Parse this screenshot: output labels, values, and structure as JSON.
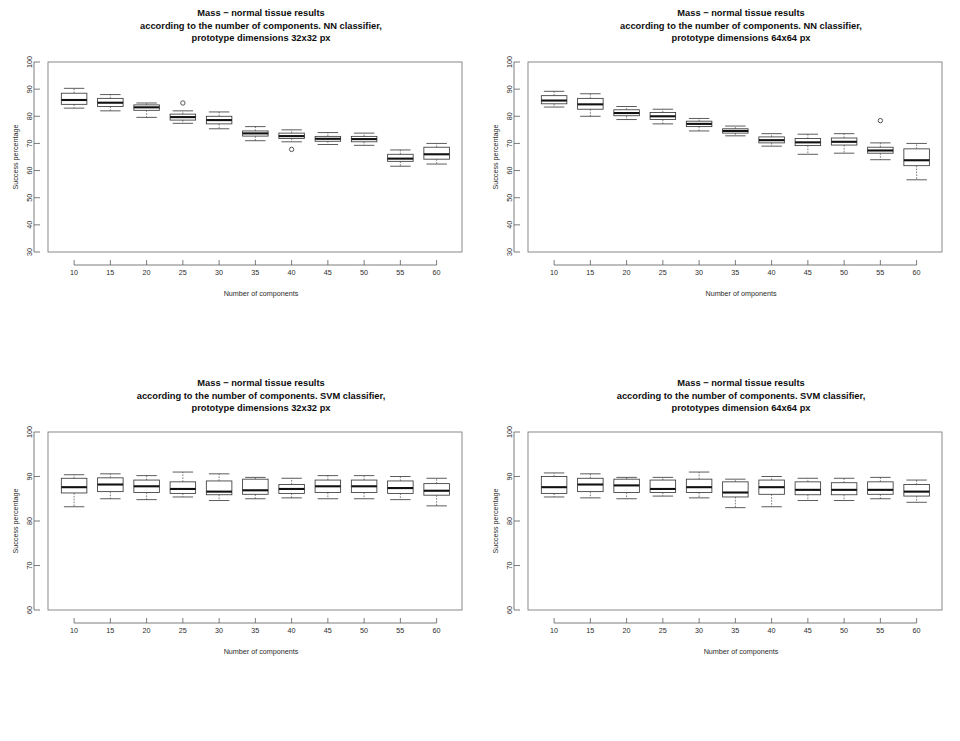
{
  "figure": {
    "width": 960,
    "height": 741,
    "background": "#ffffff",
    "line_color": "#3a3a3a",
    "text_color": "#111111",
    "layout": "2x2 grid of boxplot panels"
  },
  "chart_data": [
    {
      "id": "top-left",
      "type": "box",
      "title": "Mass − normal tissue results\naccording to the number of components. NN classifier,\nprototype dimensions 32x32 px",
      "title_lines": [
        "Mass − normal tissue results",
        "according to the number of components. NN classifier,",
        "prototype dimensions 32x32 px"
      ],
      "xlabel": "Number of components",
      "ylabel": "Success percentage",
      "categories": [
        "10",
        "15",
        "20",
        "25",
        "30",
        "35",
        "40",
        "45",
        "50",
        "55",
        "60"
      ],
      "ylim": [
        30,
        100
      ],
      "yticks": [
        30,
        40,
        50,
        60,
        70,
        80,
        90,
        100
      ],
      "grid": false,
      "legend": "none",
      "boxes": [
        {
          "category": "10",
          "min": 83.0,
          "q1": 84.4,
          "median": 86.0,
          "q3": 88.5,
          "max": 90.3,
          "outliers": []
        },
        {
          "category": "15",
          "min": 82.0,
          "q1": 83.6,
          "median": 85.0,
          "q3": 86.6,
          "max": 88.0,
          "outliers": []
        },
        {
          "category": "20",
          "min": 79.6,
          "q1": 82.2,
          "median": 83.3,
          "q3": 84.2,
          "max": 84.9,
          "outliers": []
        },
        {
          "category": "25",
          "min": 77.4,
          "q1": 78.6,
          "median": 79.7,
          "q3": 80.8,
          "max": 82.0,
          "outliers": [
            84.9
          ]
        },
        {
          "category": "30",
          "min": 75.4,
          "q1": 77.2,
          "median": 78.6,
          "q3": 80.0,
          "max": 81.6,
          "outliers": []
        },
        {
          "category": "35",
          "min": 71.0,
          "q1": 72.7,
          "median": 73.7,
          "q3": 74.6,
          "max": 76.2,
          "outliers": []
        },
        {
          "category": "40",
          "min": 70.6,
          "q1": 71.8,
          "median": 72.7,
          "q3": 73.8,
          "max": 75.0,
          "outliers": [
            67.8
          ]
        },
        {
          "category": "45",
          "min": 69.6,
          "q1": 70.8,
          "median": 71.7,
          "q3": 72.6,
          "max": 74.0,
          "outliers": []
        },
        {
          "category": "50",
          "min": 69.3,
          "q1": 70.6,
          "median": 71.6,
          "q3": 72.6,
          "max": 73.8,
          "outliers": []
        },
        {
          "category": "55",
          "min": 61.6,
          "q1": 63.4,
          "median": 64.4,
          "q3": 66.0,
          "max": 67.6,
          "outliers": []
        },
        {
          "category": "60",
          "min": 62.4,
          "q1": 64.2,
          "median": 66.0,
          "q3": 68.6,
          "max": 70.0,
          "outliers": []
        }
      ]
    },
    {
      "id": "top-right",
      "type": "box",
      "title": "Mass − normal tissue results\naccording to the number of components. NN classifier,\nprototype dimensions 64x64 px",
      "title_lines": [
        "Mass − normal tissue results",
        "according to the number of components. NN classifier,",
        "prototype dimensions 64x64 px"
      ],
      "xlabel": "Number of omponents",
      "ylabel": "Success percentage",
      "categories": [
        "10",
        "15",
        "20",
        "25",
        "30",
        "35",
        "40",
        "45",
        "50",
        "55",
        "60"
      ],
      "ylim": [
        30,
        100
      ],
      "yticks": [
        30,
        40,
        50,
        60,
        70,
        80,
        90,
        100
      ],
      "grid": false,
      "legend": "none",
      "boxes": [
        {
          "category": "10",
          "min": 83.4,
          "q1": 84.6,
          "median": 85.8,
          "q3": 87.6,
          "max": 89.2,
          "outliers": []
        },
        {
          "category": "15",
          "min": 80.0,
          "q1": 82.6,
          "median": 84.4,
          "q3": 86.6,
          "max": 88.3,
          "outliers": []
        },
        {
          "category": "20",
          "min": 78.8,
          "q1": 80.2,
          "median": 81.2,
          "q3": 82.4,
          "max": 83.6,
          "outliers": []
        },
        {
          "category": "25",
          "min": 77.2,
          "q1": 78.8,
          "median": 80.0,
          "q3": 81.4,
          "max": 82.6,
          "outliers": []
        },
        {
          "category": "30",
          "min": 74.6,
          "q1": 76.2,
          "median": 77.2,
          "q3": 78.2,
          "max": 79.2,
          "outliers": []
        },
        {
          "category": "35",
          "min": 72.8,
          "q1": 73.8,
          "median": 74.6,
          "q3": 75.4,
          "max": 76.4,
          "outliers": []
        },
        {
          "category": "40",
          "min": 69.0,
          "q1": 70.2,
          "median": 71.2,
          "q3": 72.4,
          "max": 73.6,
          "outliers": []
        },
        {
          "category": "45",
          "min": 66.0,
          "q1": 69.2,
          "median": 70.4,
          "q3": 71.8,
          "max": 73.4,
          "outliers": []
        },
        {
          "category": "50",
          "min": 66.4,
          "q1": 69.4,
          "median": 70.6,
          "q3": 72.0,
          "max": 73.6,
          "outliers": []
        },
        {
          "category": "55",
          "min": 64.0,
          "q1": 66.4,
          "median": 67.4,
          "q3": 68.6,
          "max": 70.2,
          "outliers": [
            78.4
          ]
        },
        {
          "category": "60",
          "min": 56.6,
          "q1": 61.8,
          "median": 63.8,
          "q3": 68.0,
          "max": 70.0,
          "outliers": []
        }
      ]
    },
    {
      "id": "bottom-left",
      "type": "box",
      "title": "Mass − normal tissue results\naccording to the number of components. SVM classifier,\nprototype dimensions 32x32 px",
      "title_lines": [
        "Mass − normal tissue results",
        "according to the number of components. SVM classifier,",
        "prototype dimensions 32x32 px"
      ],
      "xlabel": "Number of components",
      "ylabel": "Success percentage",
      "categories": [
        "10",
        "15",
        "20",
        "25",
        "30",
        "35",
        "40",
        "45",
        "50",
        "55",
        "60"
      ],
      "ylim": [
        60,
        100
      ],
      "yticks": [
        60,
        70,
        80,
        90,
        100
      ],
      "grid": false,
      "legend": "none",
      "boxes": [
        {
          "category": "10",
          "min": 83.2,
          "q1": 86.3,
          "median": 87.6,
          "q3": 89.6,
          "max": 90.4,
          "outliers": []
        },
        {
          "category": "15",
          "min": 85.0,
          "q1": 86.6,
          "median": 88.2,
          "q3": 89.7,
          "max": 90.6,
          "outliers": []
        },
        {
          "category": "20",
          "min": 84.8,
          "q1": 86.4,
          "median": 87.8,
          "q3": 89.2,
          "max": 90.2,
          "outliers": []
        },
        {
          "category": "25",
          "min": 85.4,
          "q1": 86.2,
          "median": 87.2,
          "q3": 88.8,
          "max": 91.0,
          "outliers": []
        },
        {
          "category": "30",
          "min": 84.6,
          "q1": 85.9,
          "median": 86.6,
          "q3": 89.0,
          "max": 90.6,
          "outliers": []
        },
        {
          "category": "35",
          "min": 85.0,
          "q1": 86.0,
          "median": 86.9,
          "q3": 89.4,
          "max": 89.8,
          "outliers": []
        },
        {
          "category": "40",
          "min": 85.2,
          "q1": 86.2,
          "median": 87.2,
          "q3": 88.2,
          "max": 89.6,
          "outliers": []
        },
        {
          "category": "45",
          "min": 85.0,
          "q1": 86.4,
          "median": 87.8,
          "q3": 89.2,
          "max": 90.2,
          "outliers": []
        },
        {
          "category": "50",
          "min": 85.0,
          "q1": 86.4,
          "median": 87.8,
          "q3": 89.2,
          "max": 90.2,
          "outliers": []
        },
        {
          "category": "55",
          "min": 84.8,
          "q1": 86.2,
          "median": 87.4,
          "q3": 89.0,
          "max": 90.0,
          "outliers": []
        },
        {
          "category": "60",
          "min": 83.4,
          "q1": 85.8,
          "median": 86.8,
          "q3": 88.4,
          "max": 89.6,
          "outliers": []
        }
      ]
    },
    {
      "id": "bottom-right",
      "type": "box",
      "title": "Mass − normal tissue results\naccording to the number of components. SVM classifier,\nprototypes dimension 64x64 px",
      "title_lines": [
        "Mass − normal tissue results",
        "according to the number of components. SVM classifier,",
        "prototypes dimension 64x64 px"
      ],
      "xlabel": "Number of components",
      "ylabel": "Success percentage",
      "categories": [
        "10",
        "15",
        "20",
        "25",
        "30",
        "35",
        "40",
        "45",
        "50",
        "55",
        "60"
      ],
      "ylim": [
        60,
        100
      ],
      "yticks": [
        60,
        70,
        80,
        90,
        100
      ],
      "grid": false,
      "legend": "none",
      "boxes": [
        {
          "category": "10",
          "min": 85.4,
          "q1": 86.2,
          "median": 87.6,
          "q3": 90.0,
          "max": 90.8,
          "outliers": []
        },
        {
          "category": "15",
          "min": 85.2,
          "q1": 86.6,
          "median": 88.2,
          "q3": 89.6,
          "max": 90.6,
          "outliers": []
        },
        {
          "category": "20",
          "min": 85.0,
          "q1": 86.4,
          "median": 88.0,
          "q3": 89.4,
          "max": 89.8,
          "outliers": []
        },
        {
          "category": "25",
          "min": 85.6,
          "q1": 86.4,
          "median": 87.2,
          "q3": 89.2,
          "max": 89.8,
          "outliers": []
        },
        {
          "category": "30",
          "min": 85.2,
          "q1": 86.4,
          "median": 87.6,
          "q3": 89.4,
          "max": 91.0,
          "outliers": []
        },
        {
          "category": "35",
          "min": 83.0,
          "q1": 85.4,
          "median": 86.4,
          "q3": 88.8,
          "max": 89.4,
          "outliers": []
        },
        {
          "category": "40",
          "min": 83.2,
          "q1": 86.0,
          "median": 87.6,
          "q3": 89.2,
          "max": 90.0,
          "outliers": []
        },
        {
          "category": "45",
          "min": 84.6,
          "q1": 85.9,
          "median": 87.0,
          "q3": 88.8,
          "max": 89.6,
          "outliers": []
        },
        {
          "category": "50",
          "min": 84.6,
          "q1": 85.9,
          "median": 87.0,
          "q3": 88.6,
          "max": 89.6,
          "outliers": []
        },
        {
          "category": "55",
          "min": 85.0,
          "q1": 86.0,
          "median": 87.0,
          "q3": 88.8,
          "max": 89.8,
          "outliers": []
        },
        {
          "category": "60",
          "min": 84.2,
          "q1": 85.6,
          "median": 86.6,
          "q3": 88.2,
          "max": 89.2,
          "outliers": []
        }
      ]
    }
  ]
}
